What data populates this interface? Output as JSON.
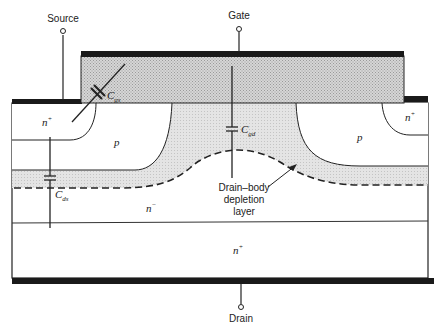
{
  "figure": {
    "type": "power MOSFET cross-section with parasitic capacitances",
    "terminals": {
      "source": "Source",
      "gate": "Gate",
      "drain": "Drain"
    },
    "regions": {
      "n_plus_left": "n",
      "n_plus_left_sup": "+",
      "n_plus_right": "n",
      "n_plus_right_sup": "+",
      "p_left": "p",
      "p_right": "p",
      "n_minus": "n",
      "n_minus_sup": "−",
      "n_plus_substrate": "n",
      "n_plus_substrate_sup": "+"
    },
    "capacitors": {
      "cgs": "C",
      "cgs_sub": "gs",
      "cgd": "C",
      "cgd_sub": "gd",
      "cds": "C",
      "cds_sub": "ds"
    },
    "annotation": {
      "line1": "Drain–body",
      "line2": "depletion",
      "line3": "layer"
    }
  },
  "colors": {
    "metal": "#1a1a1a",
    "gate_fill": "#c9c9c9",
    "depletion_fill": "#dcdcdc",
    "outline": "#222222",
    "background": "#ffffff"
  }
}
